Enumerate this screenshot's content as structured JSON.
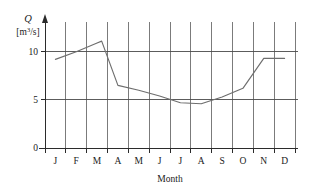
{
  "chart_data": {
    "type": "line",
    "title": "",
    "subtitle": "",
    "xlabel": "Month",
    "ylabel": "Q",
    "y_unit": "[m3/s]",
    "y_unit_base": "[m",
    "y_unit_exp": "3",
    "y_unit_tail": "/s]",
    "categories": [
      "J",
      "F",
      "M",
      "A",
      "M",
      "J",
      "J",
      "A",
      "S",
      "O",
      "N",
      "D"
    ],
    "category_names": [
      "January",
      "February",
      "March",
      "April",
      "May",
      "June",
      "July",
      "August",
      "September",
      "October",
      "November",
      "December"
    ],
    "series": [
      {
        "name": "Discharge",
        "values": [
          9.2,
          10.0,
          10.9,
          6.5,
          6.0,
          5.4,
          4.7,
          4.6,
          5.3,
          6.2,
          9.3,
          9.3
        ],
        "color": "#6e6e6e"
      }
    ],
    "peak": {
      "label": "M",
      "value": 11.1,
      "position": 2.72
    },
    "ytick_labels": [
      "0",
      "5",
      "10"
    ],
    "ytick_values": [
      0,
      5,
      10
    ],
    "ylim": [
      0,
      13.5
    ],
    "xlim": [
      0,
      12
    ],
    "grid": true,
    "grid_orientation": "vertical-and-horizontal",
    "legend": "none",
    "legend_position": "none",
    "axis_color": "#2b2b2b",
    "grid_color": "#7b7b7b",
    "value_line_color": "#4a4a4a",
    "background": "#ffffff"
  }
}
